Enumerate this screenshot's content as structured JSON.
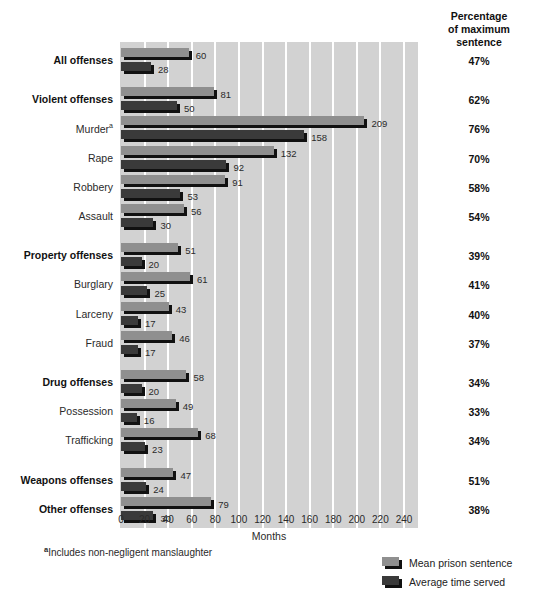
{
  "header": {
    "pct_title_line1": "Percentage",
    "pct_title_line2": "of maximum",
    "pct_title_line3": "sentence"
  },
  "axis": {
    "x_title": "Months",
    "ticks": [
      "0",
      "20",
      "40",
      "60",
      "80",
      "100",
      "120",
      "140",
      "160",
      "180",
      "200",
      "220",
      "240"
    ]
  },
  "footnote": {
    "marker": "a",
    "text": "Includes non-negligent manslaughter"
  },
  "legend": {
    "items": [
      {
        "label": "Mean prison sentence",
        "key": "mean",
        "color": "#8f8f8f"
      },
      {
        "label": "Average time served",
        "key": "served",
        "color": "#3a3a3a"
      }
    ]
  },
  "chart_data": {
    "type": "bar",
    "title": "",
    "xlabel": "Months",
    "ylabel": "",
    "xlim": [
      0,
      240
    ],
    "grid": true,
    "orientation": "horizontal",
    "legend_position": "bottom-right",
    "categories": [
      "All offenses",
      "Violent offenses",
      "Murder",
      "Rape",
      "Robbery",
      "Assault",
      "Property offenses",
      "Burglary",
      "Larceny",
      "Fraud",
      "Drug offenses",
      "Possession",
      "Trafficking",
      "Weapons offenses",
      "Other offenses"
    ],
    "series": [
      {
        "name": "Mean prison sentence",
        "values": [
          60,
          81,
          209,
          132,
          91,
          56,
          51,
          61,
          43,
          46,
          58,
          49,
          68,
          47,
          79
        ]
      },
      {
        "name": "Average time served",
        "values": [
          28,
          50,
          158,
          92,
          53,
          30,
          20,
          25,
          17,
          17,
          20,
          16,
          23,
          24,
          30
        ]
      }
    ],
    "annotations": {
      "percent_of_maximum_sentence": [
        "47%",
        "62%",
        "76%",
        "70%",
        "58%",
        "54%",
        "39%",
        "41%",
        "40%",
        "37%",
        "34%",
        "33%",
        "34%",
        "51%",
        "38%"
      ]
    }
  },
  "rows": [
    {
      "label": "All offenses",
      "bold": true,
      "sup": "",
      "mean": 60,
      "served": 28,
      "pct": "47%",
      "group_start": true
    },
    {
      "label": "Violent offenses",
      "bold": true,
      "sup": "",
      "mean": 81,
      "served": 50,
      "pct": "62%",
      "group_start": true
    },
    {
      "label": "Murder",
      "bold": false,
      "sup": "a",
      "mean": 209,
      "served": 158,
      "pct": "76%",
      "group_start": false
    },
    {
      "label": "Rape",
      "bold": false,
      "sup": "",
      "mean": 132,
      "served": 92,
      "pct": "70%",
      "group_start": false
    },
    {
      "label": "Robbery",
      "bold": false,
      "sup": "",
      "mean": 91,
      "served": 53,
      "pct": "58%",
      "group_start": false
    },
    {
      "label": "Assault",
      "bold": false,
      "sup": "",
      "mean": 56,
      "served": 30,
      "pct": "54%",
      "group_start": false
    },
    {
      "label": "Property offenses",
      "bold": true,
      "sup": "",
      "mean": 51,
      "served": 20,
      "pct": "39%",
      "group_start": true
    },
    {
      "label": "Burglary",
      "bold": false,
      "sup": "",
      "mean": 61,
      "served": 25,
      "pct": "41%",
      "group_start": false
    },
    {
      "label": "Larceny",
      "bold": false,
      "sup": "",
      "mean": 43,
      "served": 17,
      "pct": "40%",
      "group_start": false
    },
    {
      "label": "Fraud",
      "bold": false,
      "sup": "",
      "mean": 46,
      "served": 17,
      "pct": "37%",
      "group_start": false
    },
    {
      "label": "Drug offenses",
      "bold": true,
      "sup": "",
      "mean": 58,
      "served": 20,
      "pct": "34%",
      "group_start": true
    },
    {
      "label": "Possession",
      "bold": false,
      "sup": "",
      "mean": 49,
      "served": 16,
      "pct": "33%",
      "group_start": false
    },
    {
      "label": "Trafficking",
      "bold": false,
      "sup": "",
      "mean": 68,
      "served": 23,
      "pct": "34%",
      "group_start": false
    },
    {
      "label": "Weapons offenses",
      "bold": true,
      "sup": "",
      "mean": 47,
      "served": 24,
      "pct": "51%",
      "group_start": true
    },
    {
      "label": "Other offenses",
      "bold": true,
      "sup": "",
      "mean": 79,
      "served": 30,
      "pct": "38%",
      "group_start": false
    }
  ]
}
